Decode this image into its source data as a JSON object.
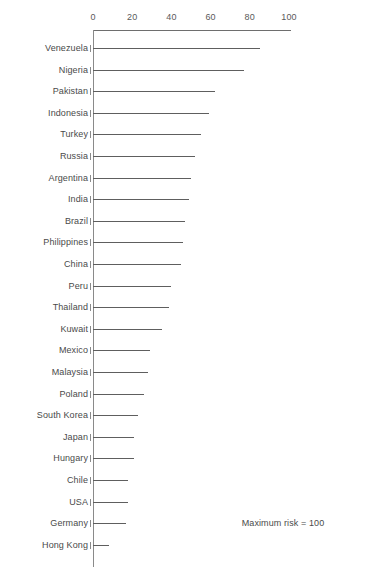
{
  "chart_data": {
    "type": "bar",
    "orientation": "horizontal",
    "title": "",
    "subtitle": "",
    "xlabel": "",
    "ylabel": "",
    "xlim": [
      0,
      100
    ],
    "grid": false,
    "legend": null,
    "annotation": "Maximum risk = 100",
    "xticks": [
      0,
      20,
      40,
      60,
      80,
      100
    ],
    "xtick_labels": [
      "0",
      "20",
      "40",
      "60",
      "80",
      "100"
    ],
    "categories": [
      "Venezuela",
      "Nigeria",
      "Pakistan",
      "Indonesia",
      "Turkey",
      "Russia",
      "Argentina",
      "India",
      "Brazil",
      "Philippines",
      "China",
      "Peru",
      "Thailand",
      "Kuwait",
      "Mexico",
      "Malaysia",
      "Poland",
      "South Korea",
      "Japan",
      "Hungary",
      "Chile",
      "USA",
      "Germany",
      "Hong Kong"
    ],
    "values": [
      85,
      77,
      62,
      59,
      55,
      52,
      50,
      49,
      47,
      46,
      45,
      40,
      39,
      35,
      29,
      28,
      26,
      23,
      21,
      21,
      18,
      18,
      17,
      8
    ]
  }
}
